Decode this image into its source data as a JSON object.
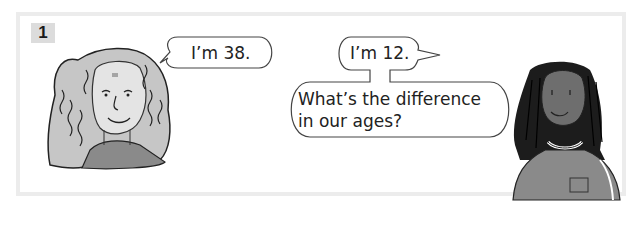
{
  "panel": {
    "number": "1"
  },
  "characters": [
    {
      "name": "woman",
      "speech": "I’m 38."
    },
    {
      "name": "girl",
      "speech": "I’m 12."
    }
  ],
  "question": {
    "line1": "What’s the difference",
    "line2": "in our ages?"
  },
  "colors": {
    "frame": "#ececec",
    "badge_bg": "#dcdcdc",
    "hair_light": "#bdbdbd",
    "hair_dark": "#1c1c1c",
    "skin_dark": "#6e6e6e",
    "shirt": "#8a8a8a"
  }
}
